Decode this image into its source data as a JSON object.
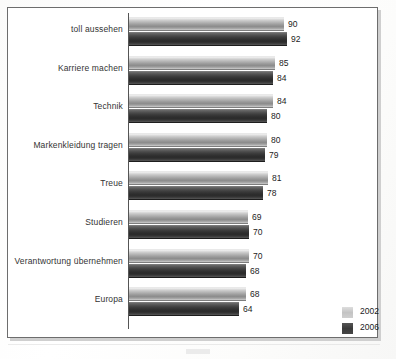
{
  "chart_data": {
    "type": "bar",
    "orientation": "horizontal",
    "title": "",
    "subtitle": "",
    "xlabel": "",
    "ylabel": "",
    "xlim": [
      0,
      100
    ],
    "grid": false,
    "legend_position": "bottom-right",
    "categories": [
      "toll aussehen",
      "Karriere machen",
      "Technik",
      "Markenkleidung tragen",
      "Treue",
      "Studieren",
      "Verantwortung übernehmen",
      "Europa"
    ],
    "series": [
      {
        "name": "2002",
        "color": "#c3c3c3",
        "values": [
          90,
          85,
          84,
          80,
          81,
          69,
          70,
          68
        ]
      },
      {
        "name": "2006",
        "color": "#3a3a3a",
        "values": [
          92,
          84,
          80,
          79,
          78,
          70,
          68,
          64
        ]
      }
    ]
  },
  "legend": {
    "items": [
      {
        "label": "2002",
        "swatch": "legend-swatch-2002"
      },
      {
        "label": "2006",
        "swatch": "legend-swatch-2006"
      }
    ]
  }
}
